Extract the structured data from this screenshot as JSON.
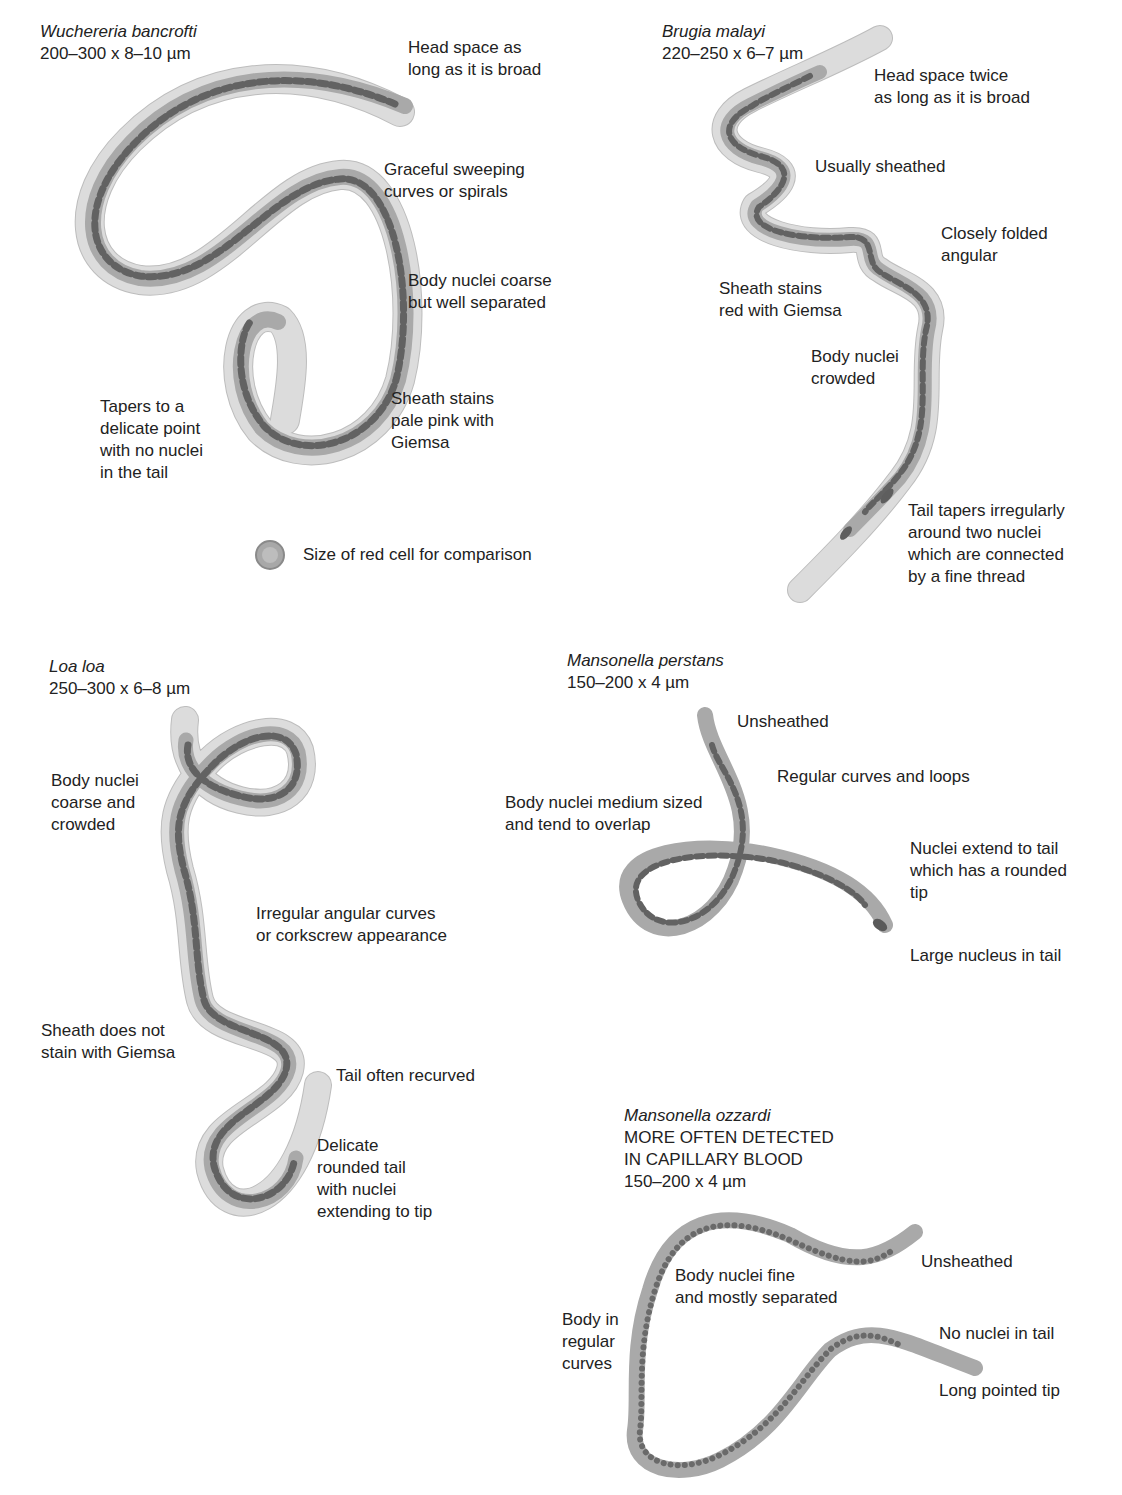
{
  "species": [
    {
      "name": "Wuchereria bancrofti",
      "size": "200–300 x 8–10 µm",
      "labels": [
        "Head space as\nlong as it is broad",
        "Graceful sweeping\ncurves or spirals",
        "Body nuclei coarse\nbut well separated",
        "Sheath stains\npale pink with\nGiemsa",
        "Tapers to a\ndelicate point\nwith no nuclei\nin the tail"
      ]
    },
    {
      "name": "Brugia malayi",
      "size": "220–250 x 6–7 µm",
      "labels": [
        "Head space twice\nas long as it is broad",
        "Usually sheathed",
        "Closely folded\nangular",
        "Sheath stains\nred with Giemsa",
        "Body nuclei\ncrowded",
        "Tail tapers irregularly\naround two nuclei\nwhich are connected\nby a fine thread"
      ]
    },
    {
      "name": "Loa loa",
      "size": "250–300 x 6–8 µm",
      "labels": [
        "Body nuclei\ncoarse and\ncrowded",
        "Irregular angular curves\nor corkscrew appearance",
        "Sheath does not\nstain with Giemsa",
        "Tail often recurved",
        "Delicate\nrounded tail\nwith nuclei\nextending to tip"
      ]
    },
    {
      "name": "Mansonella perstans",
      "size": "150–200 x 4 µm",
      "labels": [
        "Unsheathed",
        "Regular curves and loops",
        "Body nuclei medium sized\nand tend to overlap",
        "Nuclei extend to tail\nwhich has a rounded\ntip",
        "Large nucleus in tail"
      ]
    },
    {
      "name": "Mansonella ozzardi",
      "note": "MORE OFTEN DETECTED\nIN CAPILLARY BLOOD",
      "size": "150–200 x 4 µm",
      "labels": [
        "Unsheathed",
        "Body nuclei fine\nand mostly separated",
        "Body in\nregular\ncurves",
        "No nuclei in tail",
        "Long pointed tip"
      ]
    }
  ],
  "legend": {
    "red_cell": "Size of red cell for comparison"
  },
  "colors": {
    "sheath": "#dcdcdc",
    "body": "#a9a9a9",
    "nuclei": "#626262",
    "background": "#ffffff"
  }
}
